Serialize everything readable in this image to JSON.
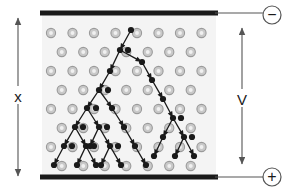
{
  "diagram": {
    "labels": {
      "gap_distance": "x",
      "voltage": "V",
      "negative_terminal": "−",
      "positive_terminal": "+"
    },
    "colors": {
      "background": "#ffffff",
      "gas_region": "#f4f4f4",
      "electrode": "#1a1a1a",
      "atom_fill": "#c9c9c9",
      "atom_ring": "#9a9a9a",
      "atom_core": "#f0f0f0",
      "electron": "#1a1a1a",
      "wire": "#555555",
      "dimension_arrow": "#555555",
      "text": "#1a1a1a"
    },
    "geometry": {
      "width": 292,
      "height": 193,
      "gas_left": 42,
      "gas_right": 216,
      "gas_top": 15,
      "gas_bottom": 177,
      "electrode_top_y": 13,
      "electrode_bottom_y": 177,
      "electrode_thickness": 5,
      "atom_radius": 4.6,
      "atom_cols": 8,
      "atom_rows": 9,
      "col_spacing": 21.5,
      "row_spacing": 19
    },
    "terminals": {
      "negative": {
        "cx": 272,
        "cy": 15,
        "r": 9
      },
      "positive": {
        "cx": 272,
        "cy": 177,
        "r": 9
      }
    },
    "dimension_x": {
      "x": 18,
      "top": 18,
      "bottom": 176,
      "label_y": 98
    },
    "dimension_v": {
      "x": 242,
      "top": 28,
      "bottom": 164,
      "label_y": 101
    },
    "atom_grid": [
      {
        "y": 33,
        "offset": 0,
        "count": 8
      },
      {
        "y": 52,
        "offset": 10.75,
        "count": 8
      },
      {
        "y": 71,
        "offset": 0,
        "count": 8
      },
      {
        "y": 90,
        "offset": 10.75,
        "count": 8
      },
      {
        "y": 109,
        "offset": 0,
        "count": 8
      },
      {
        "y": 128,
        "offset": 10.75,
        "count": 8
      },
      {
        "y": 147,
        "offset": 0,
        "count": 8
      },
      {
        "y": 166,
        "offset": 10.75,
        "count": 8
      }
    ],
    "avalanche": {
      "description": "Branching electron avalanche cascading from the negative top electrode toward the positive bottom electrode",
      "segments": [
        {
          "from": [
            131,
            30
          ],
          "to": [
            120,
            50
          ]
        },
        {
          "from": [
            120,
            50
          ],
          "to": [
            110,
            71
          ]
        },
        {
          "from": [
            110,
            71
          ],
          "to": [
            99,
            90
          ]
        },
        {
          "from": [
            99,
            90
          ],
          "to": [
            87,
            108
          ]
        },
        {
          "from": [
            87,
            108
          ],
          "to": [
            75,
            127
          ]
        },
        {
          "from": [
            75,
            127
          ],
          "to": [
            64,
            146
          ]
        },
        {
          "from": [
            64,
            146
          ],
          "to": [
            54,
            165
          ]
        },
        {
          "from": [
            75,
            127
          ],
          "to": [
            86,
            146
          ]
        },
        {
          "from": [
            86,
            146
          ],
          "to": [
            77,
            165
          ]
        },
        {
          "from": [
            86,
            146
          ],
          "to": [
            96,
            165
          ]
        },
        {
          "from": [
            87,
            108
          ],
          "to": [
            99,
            127
          ]
        },
        {
          "from": [
            99,
            127
          ],
          "to": [
            90,
            146
          ]
        },
        {
          "from": [
            99,
            127
          ],
          "to": [
            110,
            146
          ]
        },
        {
          "from": [
            110,
            146
          ],
          "to": [
            101,
            165
          ]
        },
        {
          "from": [
            110,
            146
          ],
          "to": [
            121,
            165
          ]
        },
        {
          "from": [
            99,
            90
          ],
          "to": [
            112,
            108
          ]
        },
        {
          "from": [
            112,
            108
          ],
          "to": [
            124,
            127
          ]
        },
        {
          "from": [
            124,
            127
          ],
          "to": [
            135,
            146
          ]
        },
        {
          "from": [
            135,
            146
          ],
          "to": [
            146,
            165
          ]
        },
        {
          "from": [
            120,
            50
          ],
          "to": [
            142,
            62
          ]
        },
        {
          "from": [
            142,
            62
          ],
          "to": [
            152,
            80
          ]
        },
        {
          "from": [
            152,
            80
          ],
          "to": [
            163,
            99
          ]
        },
        {
          "from": [
            163,
            99
          ],
          "to": [
            173,
            118
          ]
        },
        {
          "from": [
            173,
            118
          ],
          "to": [
            163,
            137
          ]
        },
        {
          "from": [
            163,
            137
          ],
          "to": [
            154,
            156
          ]
        },
        {
          "from": [
            173,
            118
          ],
          "to": [
            184,
            137
          ]
        },
        {
          "from": [
            184,
            137
          ],
          "to": [
            175,
            156
          ]
        },
        {
          "from": [
            184,
            137
          ],
          "to": [
            194,
            156
          ]
        }
      ],
      "electrons": [
        [
          131,
          30
        ],
        [
          120,
          50
        ],
        [
          128,
          50
        ],
        [
          110,
          71
        ],
        [
          99,
          90
        ],
        [
          108,
          90
        ],
        [
          87,
          108
        ],
        [
          96,
          108
        ],
        [
          75,
          127
        ],
        [
          83,
          127
        ],
        [
          64,
          146
        ],
        [
          72,
          146
        ],
        [
          54,
          165
        ],
        [
          86,
          146
        ],
        [
          94,
          146
        ],
        [
          77,
          165
        ],
        [
          96,
          165
        ],
        [
          99,
          127
        ],
        [
          107,
          127
        ],
        [
          90,
          146
        ],
        [
          110,
          146
        ],
        [
          118,
          146
        ],
        [
          101,
          165
        ],
        [
          121,
          165
        ],
        [
          112,
          108
        ],
        [
          124,
          127
        ],
        [
          135,
          146
        ],
        [
          146,
          165
        ],
        [
          142,
          62
        ],
        [
          152,
          80
        ],
        [
          163,
          99
        ],
        [
          173,
          118
        ],
        [
          181,
          118
        ],
        [
          163,
          137
        ],
        [
          154,
          156
        ],
        [
          184,
          137
        ],
        [
          192,
          137
        ],
        [
          175,
          156
        ],
        [
          194,
          156
        ]
      ]
    },
    "wires": [
      {
        "from": [
          215,
          13
        ],
        "to": [
          272,
          13
        ]
      },
      {
        "from": [
          215,
          177
        ],
        "to": [
          272,
          177
        ]
      }
    ]
  }
}
